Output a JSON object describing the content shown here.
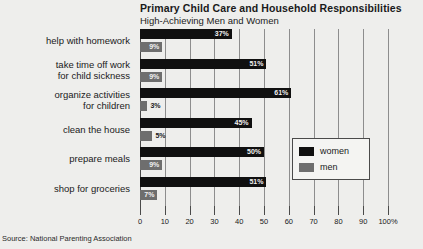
{
  "chart_data": {
    "type": "bar",
    "orientation": "horizontal",
    "title": "Primary Child Care and Household Responsibilities",
    "subtitle": "High-Achieving Men and Women",
    "xlabel": "",
    "ylabel": "",
    "xlim": [
      0,
      100
    ],
    "grid": true,
    "legend_position": "right",
    "categories": [
      "help with homework",
      "take time off work for child sickness",
      "organize activities for children",
      "clean the house",
      "prepare meals",
      "shop for groceries"
    ],
    "category_lines": [
      [
        "help with homework"
      ],
      [
        "take time off work",
        "for child sickness"
      ],
      [
        "organize activities",
        "for children"
      ],
      [
        "clean the house"
      ],
      [
        "prepare meals"
      ],
      [
        "shop for groceries"
      ]
    ],
    "series": [
      {
        "name": "women",
        "color": "#101010",
        "values": [
          37,
          51,
          61,
          45,
          50,
          51
        ],
        "labels": [
          "37%",
          "51%",
          "61%",
          "45%",
          "50%",
          "51%"
        ]
      },
      {
        "name": "men",
        "color": "#6e6e6e",
        "values": [
          9,
          9,
          3,
          5,
          9,
          7
        ],
        "labels": [
          "9%",
          "9%",
          "3%",
          "5%",
          "9%",
          "7%"
        ]
      }
    ],
    "xticks": [
      0,
      10,
      20,
      30,
      40,
      50,
      60,
      70,
      80,
      90,
      100
    ],
    "xticklabels": [
      "0",
      "10",
      "20",
      "30",
      "40",
      "50",
      "60",
      "70",
      "80",
      "90",
      "100%"
    ],
    "source": "Source: National Parenting Association"
  },
  "colors": {
    "background": "#eeeeec",
    "women": "#101010",
    "men": "#6e6e6e",
    "gridline": "#8d8d8d",
    "axis": "#4a4a4a",
    "text": "#1a1a1a"
  }
}
